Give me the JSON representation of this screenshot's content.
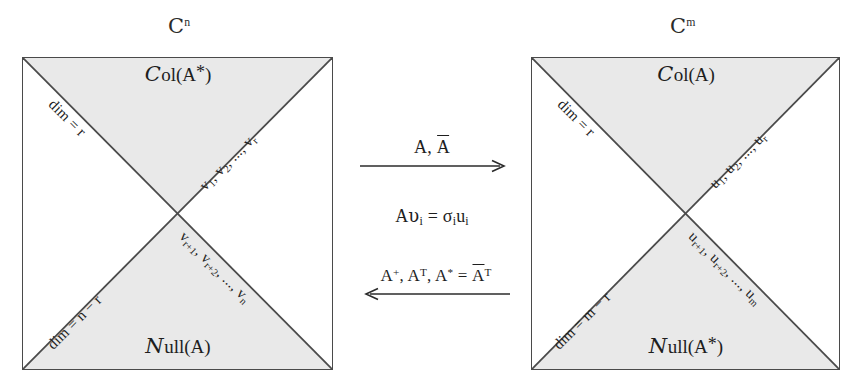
{
  "diagram": {
    "title_left_space": "C^n",
    "title_right_space": "C^m",
    "fill_color": "#e9e9e9",
    "line_color": "#4a4a4a",
    "text_color": "#1e1e1e"
  },
  "left": {
    "space": {
      "symbol": "C",
      "exponent": "n"
    },
    "top": {
      "name_script": "C",
      "name_rest": "ol(A",
      "name_star": "*",
      "name_close": ")",
      "dim": "dim = r",
      "basis": "v1, v2, ..., vr",
      "basis_parts": {
        "a": "v",
        "a_sub": "1",
        "b": "v",
        "b_sub": "2",
        "dots": ", ..., ",
        "c": "v",
        "c_sub": "r"
      }
    },
    "bottom": {
      "name_script": "N",
      "name_rest": "ull(A)",
      "dim": "dim = n − r",
      "basis": "vr+1, vr+2, ..., vn",
      "basis_parts": {
        "a": "v",
        "a_sub": "r+1",
        "b": "v",
        "b_sub": "r+2",
        "dots": ", ..., ",
        "c": "v",
        "c_sub": "n"
      }
    }
  },
  "right": {
    "space": {
      "symbol": "C",
      "exponent": "m"
    },
    "top": {
      "name_script": "C",
      "name_rest": "ol(A)",
      "dim": "dim = r",
      "basis": "u1, u2, ..., ur",
      "basis_parts": {
        "a": "u",
        "a_sub": "1",
        "b": "u",
        "b_sub": "2",
        "dots": ", ..., ",
        "c": "u",
        "c_sub": "r"
      }
    },
    "bottom": {
      "name_script": "N",
      "name_rest": "ull(A",
      "name_star": "*",
      "name_close": ")",
      "dim": "dim = m − r",
      "basis": "ur+1, ur+2, ..., um",
      "basis_parts": {
        "a": "u",
        "a_sub": "r+1",
        "b": "u",
        "b_sub": "r+2",
        "dots": ", ..., ",
        "c": "u",
        "c_sub": "m"
      }
    }
  },
  "center": {
    "forward_label_plain": "A, Ā",
    "forward_first": "A, ",
    "forward_overline": "A",
    "equation_plain": "Avᵢ = σᵢuᵢ",
    "equation": {
      "matrix": "A",
      "vec": "υ",
      "vec_sub": "i",
      "equals": " = ",
      "sigma": "σ",
      "sigma_sub": "i",
      "u": "u",
      "u_sub": "i"
    },
    "backward_label_plain": "A⁺, Aᵀ, A* = Āᵀ",
    "backward": {
      "pinv": "A",
      "pinv_sup": "+",
      "sep1": ", ",
      "transpose": "A",
      "transpose_sup": "T",
      "sep2": ", ",
      "adjoint": "A",
      "adjoint_sup": "*",
      "equals": " = ",
      "conj": "A",
      "conj_sup": "T"
    }
  }
}
